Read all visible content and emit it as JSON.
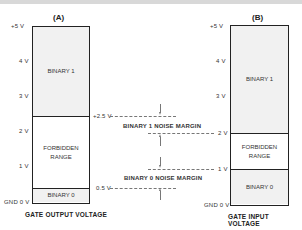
{
  "diagram": {
    "left": {
      "title": "(A)",
      "caption": "GATE OUTPUT VOLTAGE",
      "axis_labels": [
        "+5 V",
        "4 V",
        "3 V",
        "2 V",
        "1 V",
        "GND 0 V"
      ],
      "regions": [
        {
          "name": "BINARY 1",
          "from_v": 2.5,
          "to_v": 5
        },
        {
          "name": "FORBIDDEN RANGE",
          "from_v": 0.5,
          "to_v": 2.5
        },
        {
          "name": "BINARY 0",
          "from_v": 0,
          "to_v": 0.5
        }
      ],
      "region_labels": {
        "binary1": "BINARY 1",
        "forbidden_1": "FORBIDDEN",
        "forbidden_2": "RANGE",
        "binary0": "BINARY 0"
      }
    },
    "right": {
      "title": "(B)",
      "caption": "GATE INPUT VOLTAGE",
      "axis_labels": [
        "+5 V",
        "4 V",
        "3 V",
        "2 V",
        "1 V",
        "GND 0 V"
      ],
      "regions": [
        {
          "name": "BINARY 1",
          "from_v": 2,
          "to_v": 5
        },
        {
          "name": "FORBIDDEN RANGE",
          "from_v": 1,
          "to_v": 2
        },
        {
          "name": "BINARY 0",
          "from_v": 0,
          "to_v": 1
        }
      ],
      "region_labels": {
        "binary1": "BINARY 1",
        "forbidden_1": "FORBIDDEN",
        "forbidden_2": "RANGE",
        "binary0": "BINARY 0"
      }
    },
    "middle": {
      "level_out_high": "+2.5 V",
      "level_out_low": "0.5 V",
      "level_in_high": "2 V",
      "level_in_low": "1 V",
      "margin_1": "BINARY 1  NOISE MARGIN",
      "margin_0": "BINARY 0 NOISE MARGIN"
    }
  }
}
